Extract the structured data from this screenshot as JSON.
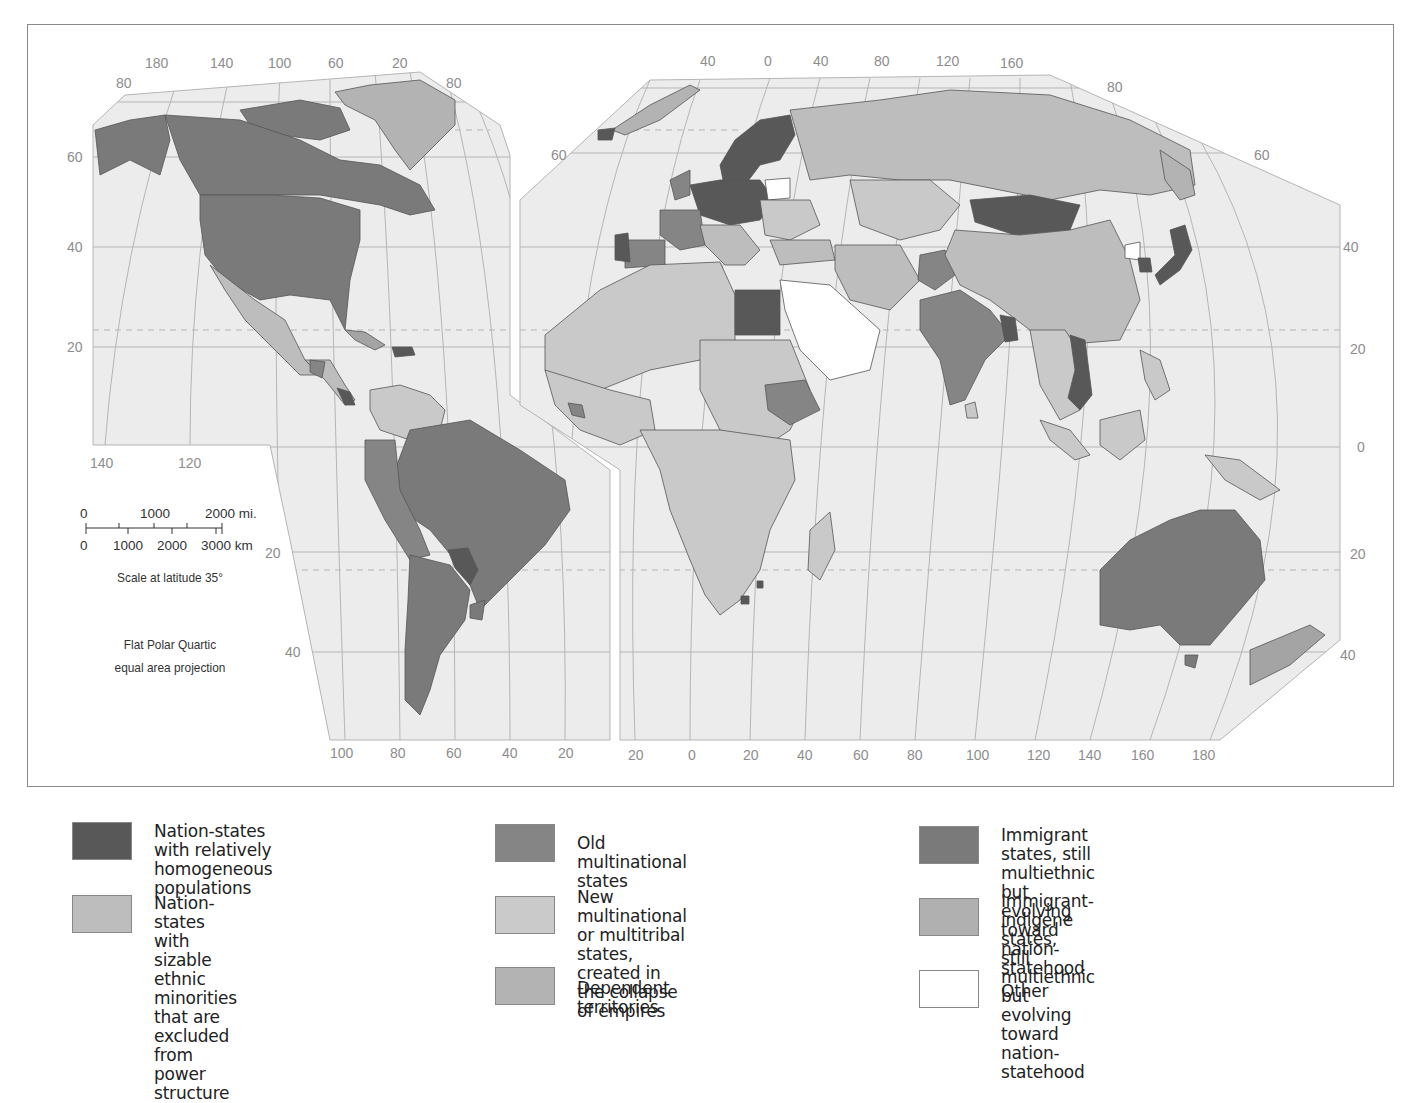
{
  "map": {
    "projection_note_line1": "Flat Polar Quartic",
    "projection_note_line2": "equal area projection",
    "scale": {
      "miles_labels": [
        "0",
        "1000",
        "2000 mi."
      ],
      "km_labels": [
        "0",
        "1000",
        "2000",
        "3000 km"
      ],
      "caption": "Scale at latitude 35°"
    },
    "americas_panel": {
      "top_longitudes": [
        "180",
        "140",
        "100",
        "60",
        "20"
      ],
      "bottom_longitudes": [
        "100",
        "80",
        "60",
        "40",
        "20"
      ],
      "left_latitudes": [
        "80",
        "60",
        "40",
        "20"
      ],
      "right_latitude_top": "80",
      "bottom_left_longitudes": [
        "140",
        "120"
      ],
      "south_latitudes": [
        "20",
        "40"
      ]
    },
    "eastern_panel": {
      "top_longitudes": [
        "40",
        "0",
        "40",
        "80",
        "120",
        "160"
      ],
      "bottom_longitudes": [
        "20",
        "0",
        "20",
        "40",
        "60",
        "80",
        "100",
        "120",
        "140",
        "160",
        "180"
      ],
      "left_latitude": "60",
      "right_latitudes": [
        "80",
        "60",
        "40",
        "20",
        "0",
        "20",
        "40"
      ]
    },
    "colors": {
      "ocean": "#ececec",
      "grid": "#b5b5b5",
      "homogeneous": "#585858",
      "ethnic_minorities_excluded": "#bdbdbd",
      "old_multinational": "#858585",
      "new_multinational": "#c9c9c9",
      "dependent": "#b3b3b3",
      "immigrant": "#7a7a7a",
      "immigrant_indigene": "#a4a4a4",
      "other": "#ffffff"
    }
  },
  "legend": {
    "items": [
      {
        "label": "Nation-states with relatively\nhomogeneous populations",
        "color": "#585858"
      },
      {
        "label": "Nation-states with sizable\nethnic minorities that are\nexcluded from power structure",
        "color": "#bdbdbd"
      },
      {
        "label": "Old multinational states",
        "color": "#858585"
      },
      {
        "label": "New multinational or multitribal\nstates, created in the collapse\nof empires",
        "color": "#cacaca"
      },
      {
        "label": "Dependent territories",
        "color": "#b3b3b3"
      },
      {
        "label": "Immigrant states, still multiethnic\nbut evolving toward nation-statehood",
        "color": "#7a7a7a"
      },
      {
        "label": "Immigrant-indigene states,\nstill multiethnic but evolving\ntoward nation-statehood",
        "color": "#b0b0b0"
      },
      {
        "label": "Other",
        "color": "#ffffff"
      }
    ]
  }
}
